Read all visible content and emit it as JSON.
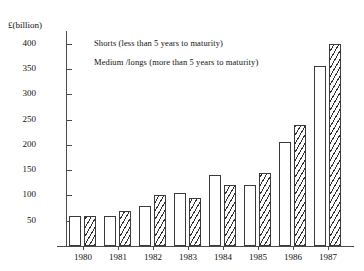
{
  "chart_data": {
    "type": "bar",
    "title": "",
    "xlabel": "",
    "ylabel": "£(billion)",
    "ylim": [
      0,
      425
    ],
    "yticks": [
      50,
      100,
      150,
      200,
      250,
      300,
      350,
      400
    ],
    "grid": false,
    "legend_position": "inside-top-left",
    "categories": [
      "1980",
      "1981",
      "1982",
      "1983",
      "1984",
      "1985",
      "1986",
      "1987"
    ],
    "series": [
      {
        "name": "Shorts (less than 5 years to maturity)",
        "pattern": "plain",
        "values": [
          60,
          60,
          80,
          105,
          140,
          120,
          205,
          355
        ]
      },
      {
        "name": "Medium /longs (more than 5 years to maturity)",
        "pattern": "diagonal-hatch",
        "values": [
          60,
          70,
          100,
          95,
          120,
          145,
          240,
          400
        ]
      }
    ]
  },
  "axis": {
    "y_title": "£(billion)"
  },
  "legend": {
    "shorts_label": "Shorts (less than 5 years to maturity)",
    "medium_label": "Medium /longs (more than 5 years to maturity)"
  },
  "colors": {
    "axis": "#4a4a4a",
    "bar_outline": "#3a3a3a",
    "hatch": "#2f2f2f",
    "background": "#ffffff"
  }
}
